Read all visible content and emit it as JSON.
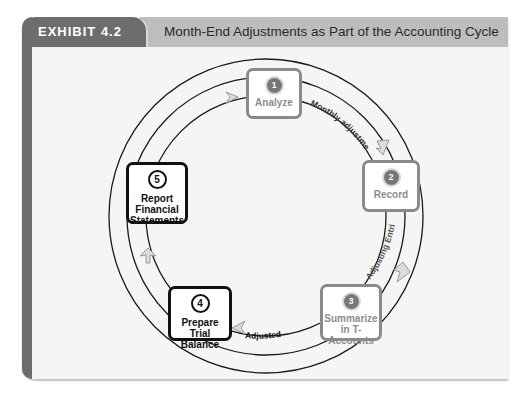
{
  "header": {
    "exhibit_label": "EXHIBIT 4.2",
    "title": "Month-End Adjustments as Part of the Accounting Cycle"
  },
  "cycle": {
    "steps": [
      {
        "number": "1",
        "label_lines": [
          "Analyze"
        ],
        "style": "grey"
      },
      {
        "number": "2",
        "label_lines": [
          "Record"
        ],
        "style": "grey"
      },
      {
        "number": "3",
        "label_lines": [
          "Summarize",
          "in T-Accounts"
        ],
        "style": "grey"
      },
      {
        "number": "4",
        "label_lines": [
          "Prepare",
          "Trial Balance"
        ],
        "style": "black"
      },
      {
        "number": "5",
        "label_lines": [
          "Report",
          "Financial",
          "Statements"
        ],
        "style": "black"
      }
    ],
    "arc_labels": {
      "monthly_adjustments": "Monthly adjustments",
      "adjusting_entries": "Adjusting Entries",
      "adjusted": "Adjusted"
    }
  },
  "colors": {
    "dark_tab": "#6d6d6d",
    "header_band": "#bdbdbd",
    "panel_bg": "#f5f5f5",
    "grey_step_border": "#8a8a8a",
    "black_step_border": "#111111",
    "arrow_fill": "#d9d9d9"
  }
}
